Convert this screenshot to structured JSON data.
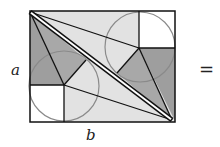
{
  "diagram": {
    "title": "",
    "labels": {
      "side_a": "a",
      "side_b": "b",
      "equals": "="
    },
    "colors": {
      "dark_fill": "#9e9e9e",
      "light_fill": "#e2e2e2",
      "white_fill": "#ffffff",
      "stroke": "#111111",
      "circle": "#8a8a8a"
    },
    "shapes": {
      "rectangle": "outer rectangle with sides a and b",
      "diagonal": "double line from top-left to bottom-right",
      "squares": [
        "top-right white square",
        "bottom-left white square"
      ],
      "circles": [
        "upper-right inscribed circle",
        "lower-left inscribed circle"
      ]
    }
  }
}
